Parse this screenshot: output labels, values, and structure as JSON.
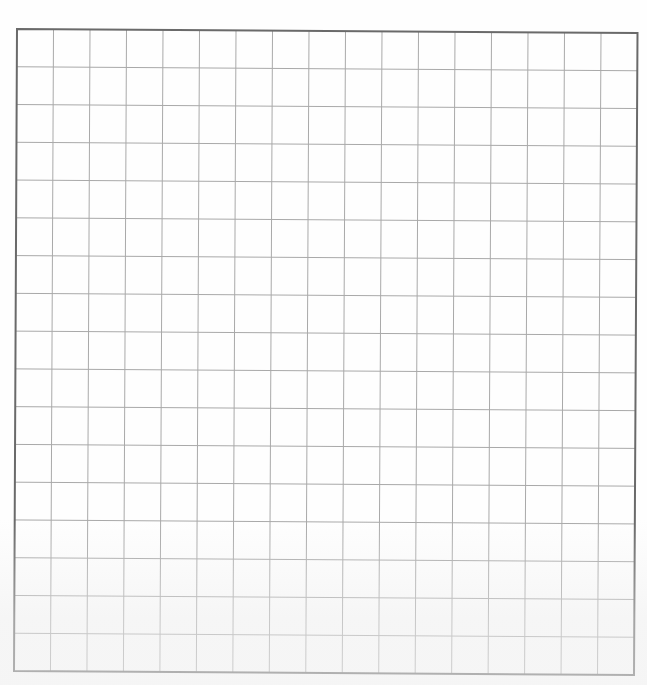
{
  "sheet": {
    "type": "graph-paper",
    "columns": 17,
    "rows": 17,
    "corners": {
      "top_left": [
        17,
        29
      ],
      "top_right": [
        637.5,
        33
      ],
      "bottom_left": [
        14,
        671
      ],
      "bottom_right": [
        634,
        675
      ]
    },
    "colors": {
      "background": "#fefefe",
      "grid_line": "#a9a9a9",
      "border_line": "#6a6a6a"
    },
    "line_widths": {
      "grid": 1,
      "border": 2
    }
  }
}
